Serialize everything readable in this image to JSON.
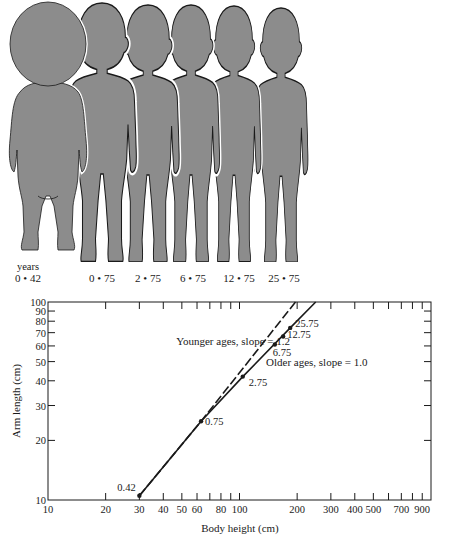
{
  "figures": {
    "years_label": "years",
    "ages": [
      "0 • 42",
      "0 • 75",
      "2 • 75",
      "6 • 75",
      "12 • 75",
      "25 • 75"
    ],
    "silhouette_color": "#8c8c8c",
    "outline_color": "#1a1a1a"
  },
  "chart_data": {
    "type": "line",
    "title": "",
    "xlabel": "Body height (cm)",
    "ylabel": "Arm length (cm)",
    "xscale": "log",
    "yscale": "log",
    "xlim": [
      10,
      1000
    ],
    "ylim": [
      10,
      100
    ],
    "x_ticks": [
      10,
      20,
      30,
      40,
      50,
      60,
      70,
      80,
      90,
      100,
      200,
      300,
      400,
      500,
      600,
      700,
      800,
      900,
      1000
    ],
    "x_tick_labels": [
      "10",
      "20",
      "30",
      "40",
      "50",
      "60",
      "80",
      "100",
      "200",
      "300",
      "400",
      "500",
      "700",
      "900"
    ],
    "y_ticks": [
      10,
      20,
      30,
      40,
      50,
      60,
      70,
      80,
      90,
      100
    ],
    "y_tick_labels": [
      "10",
      "20",
      "30",
      "40",
      "50",
      "60",
      "70",
      "80",
      "90",
      "100"
    ],
    "grid": false,
    "points": [
      {
        "label": "0.42",
        "x": 30,
        "y": 10.5
      },
      {
        "label": "0.75",
        "x": 63,
        "y": 25
      },
      {
        "label": "2.75",
        "x": 104,
        "y": 42
      },
      {
        "label": "6.75",
        "x": 153,
        "y": 61
      },
      {
        "label": "12.75",
        "x": 169,
        "y": 67
      },
      {
        "label": "25.75",
        "x": 184,
        "y": 74
      }
    ],
    "series": [
      {
        "name": "Younger ages, slope = 1.2",
        "style": "dashed",
        "slope": 1.2,
        "x": [
          30,
          63,
          196
        ],
        "y": [
          10.5,
          25,
          100
        ]
      },
      {
        "name": "Older ages, slope = 1.0",
        "style": "solid",
        "slope": 1.0,
        "x": [
          63,
          104,
          184,
          250
        ],
        "y": [
          25,
          42,
          74,
          100
        ]
      },
      {
        "name": "Growth curve",
        "style": "solid",
        "x": [
          30,
          63
        ],
        "y": [
          10.5,
          25
        ]
      }
    ],
    "annotations": [
      {
        "text": "Younger ages, slope = 1.2"
      },
      {
        "text": "Older ages, slope = 1.0"
      }
    ]
  }
}
